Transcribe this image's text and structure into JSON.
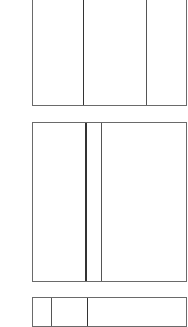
{
  "diagram": {
    "line_color": "#6a6a6a",
    "background": "#ffffff",
    "panels": [
      {
        "name": "panel-top",
        "left": 32,
        "top": -2,
        "width": 155,
        "height": 108,
        "dividers": [
          {
            "x": 50,
            "width": 1,
            "color": "#333333"
          },
          {
            "x": 113,
            "width": 1,
            "color": "#555555"
          }
        ]
      },
      {
        "name": "panel-middle",
        "left": 32,
        "top": 122,
        "width": 155,
        "height": 160,
        "dividers": [
          {
            "x": 52,
            "width": 2,
            "color": "#333333"
          },
          {
            "x": 68,
            "width": 1,
            "color": "#555555"
          }
        ]
      },
      {
        "name": "panel-bottom",
        "left": 32,
        "top": 297,
        "width": 155,
        "height": 30,
        "dividers": [
          {
            "x": 18,
            "width": 1,
            "color": "#555555"
          },
          {
            "x": 54,
            "width": 1,
            "color": "#333333"
          }
        ]
      }
    ]
  }
}
